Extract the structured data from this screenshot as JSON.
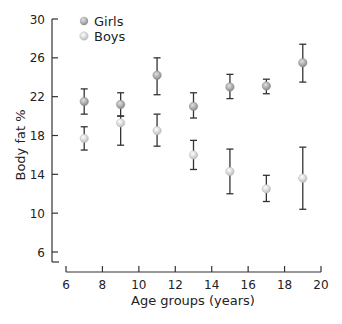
{
  "chart_data": {
    "type": "scatter",
    "title": "",
    "xlabel": "Age groups (years)",
    "ylabel": "Body fat %",
    "xlim": [
      6,
      20
    ],
    "ylim": [
      4.8,
      30
    ],
    "x_ticks": [
      6,
      8,
      10,
      12,
      14,
      16,
      18,
      20
    ],
    "y_ticks": [
      6,
      10,
      14,
      18,
      22,
      26,
      30
    ],
    "grid": false,
    "legend_position": "top-left",
    "x": [
      7,
      9,
      11,
      13,
      15,
      17,
      19
    ],
    "series": [
      {
        "name": "Girls",
        "color": "#9a9a9a",
        "values": [
          21.5,
          21.2,
          24.2,
          21.0,
          23.0,
          23.1,
          25.5
        ],
        "err_low": [
          20.2,
          20.0,
          22.2,
          19.8,
          21.8,
          22.3,
          23.5
        ],
        "err_high": [
          22.8,
          22.4,
          26.0,
          22.4,
          24.3,
          23.8,
          27.4
        ]
      },
      {
        "name": "Boys",
        "color": "#cfcfcf",
        "values": [
          17.7,
          19.3,
          18.5,
          16.0,
          14.3,
          12.5,
          13.6
        ],
        "err_low": [
          16.5,
          17.0,
          16.9,
          14.5,
          12.0,
          11.2,
          10.4
        ],
        "err_high": [
          18.9,
          20.0,
          20.2,
          17.5,
          16.6,
          13.9,
          16.8
        ]
      }
    ]
  },
  "legend": {
    "girls_label": "Girls",
    "boys_label": "Boys"
  },
  "axes": {
    "xlabel": "Age groups (years)",
    "ylabel": "Body fat %"
  }
}
